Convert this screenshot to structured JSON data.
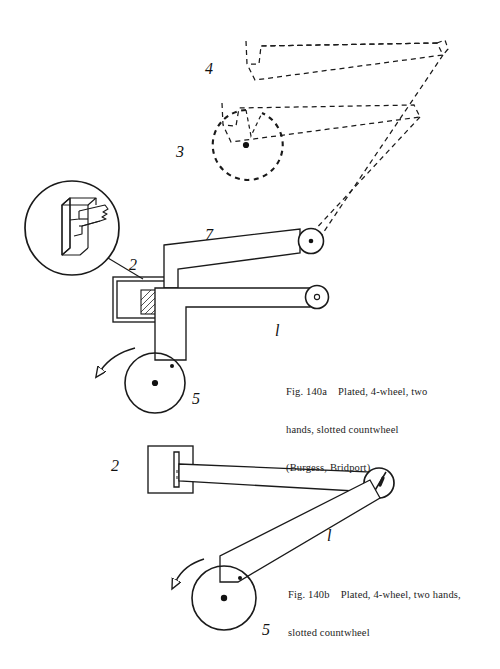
{
  "figure": {
    "background_color": "#ffffff",
    "line_color": "#1a1a1a",
    "dashed_color": "#1a1a1a"
  },
  "captions": {
    "a": {
      "line1": "Fig. 140a    Plated, 4-wheel, two",
      "line2": "hands, slotted countwheel",
      "line3": "(Burgess, Bridport)"
    },
    "b": {
      "line1": "Fig. 140b    Plated, 4-wheel, two hands,",
      "line2": "slotted countwheel"
    }
  },
  "labels": {
    "upper": [
      {
        "id": "label-4",
        "text": "4",
        "x": 205,
        "y": 60,
        "meaning": "dashed-linkage-arms"
      },
      {
        "id": "label-3",
        "text": "3",
        "x": 176,
        "y": 143,
        "meaning": "slotted-countwheel"
      },
      {
        "id": "label-7",
        "text": "7",
        "x": 205,
        "y": 226,
        "meaning": "upper-solid-arm"
      },
      {
        "id": "label-2",
        "text": "2",
        "x": 129,
        "y": 256,
        "meaning": "bracket-block"
      },
      {
        "id": "label-1",
        "text": "l",
        "x": 275,
        "y": 322,
        "meaning": "lower-solid-arm"
      },
      {
        "id": "label-5",
        "text": "5",
        "x": 192,
        "y": 390,
        "meaning": "driving-wheel"
      }
    ],
    "lower": [
      {
        "id": "label-2b",
        "text": "2",
        "x": 111,
        "y": 457,
        "meaning": "bracket-block"
      },
      {
        "id": "label-1b",
        "text": "l",
        "x": 327,
        "y": 527,
        "meaning": "connecting-arm"
      },
      {
        "id": "label-5b",
        "text": "5",
        "x": 262,
        "y": 621,
        "meaning": "driving-wheel"
      }
    ]
  },
  "parts": {
    "detail_inset": {
      "name": "slotted-lever-detail",
      "circle": {
        "cx": 72,
        "cy": 228,
        "r": 47
      },
      "leader_to": {
        "x": 143,
        "y": 279
      }
    },
    "countwheel": {
      "name": "slotted-countwheel",
      "cx": 246,
      "cy": 145,
      "r": 35,
      "style": "dashed",
      "has_center_pin": true,
      "has_slot": true
    },
    "upper_pivot": {
      "cx": 311,
      "cy": 241,
      "r": 12,
      "pin": "filled"
    },
    "lower_pivot": {
      "cx": 317,
      "cy": 297,
      "r": 11,
      "pin": "open"
    },
    "upper_wheel": {
      "cx": 155,
      "cy": 383,
      "r": 30,
      "center_pin": true,
      "crank_pin": {
        "x": 171,
        "y": 365
      }
    },
    "lower_wheel": {
      "cx": 224,
      "cy": 598,
      "r": 32,
      "center_pin": true,
      "crank_pin": {
        "x": 239,
        "y": 578
      }
    },
    "lower_pivot_slotted": {
      "cx": 378,
      "cy": 484,
      "r": 15,
      "has_slot": true
    },
    "rotation_arrows": [
      {
        "name": "rotation-arrow-upper",
        "direction": "counter-clockwise"
      },
      {
        "name": "rotation-arrow-lower",
        "direction": "counter-clockwise"
      }
    ]
  }
}
